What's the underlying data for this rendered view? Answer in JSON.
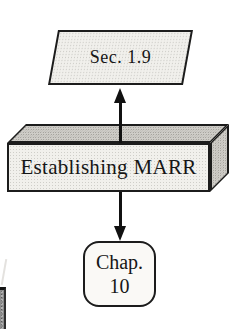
{
  "diagram": {
    "nodes": [
      {
        "id": "sec",
        "shape": "parallelogram",
        "label": "Sec. 1.9"
      },
      {
        "id": "marr",
        "shape": "box-3d",
        "label": "Establishing MARR"
      },
      {
        "id": "chap",
        "shape": "rounded-rect",
        "label": "Chap.\n10"
      }
    ],
    "edges": [
      {
        "from": "marr",
        "to": "sec",
        "direction": "up"
      },
      {
        "from": "marr",
        "to": "chap",
        "direction": "down"
      }
    ]
  },
  "colors": {
    "background": "#ffffff",
    "outline": "#1c1c1c",
    "arrow": "#111111",
    "light_fill": "#f1f0ec",
    "shaded_fill": "#cfcdc8",
    "plain_node_fill": "#faf9f6",
    "edge_artifact_gray": "#8c8c8c",
    "text": "#161616"
  }
}
